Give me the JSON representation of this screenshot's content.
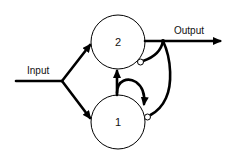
{
  "diagram": {
    "labels": {
      "input": "Input",
      "output": "Output"
    },
    "nodes": [
      {
        "id": "2",
        "label": "2",
        "cx": 118,
        "cy": 42,
        "r": 27
      },
      {
        "id": "1",
        "label": "1",
        "cx": 118,
        "cy": 122,
        "r": 27
      }
    ],
    "edges": [
      {
        "from": "input",
        "to": "2",
        "type": "excitatory"
      },
      {
        "from": "input",
        "to": "1",
        "type": "excitatory"
      },
      {
        "from": "1",
        "to": "2",
        "type": "excitatory"
      },
      {
        "from": "1",
        "to": "1",
        "type": "excitatory-self-loop"
      },
      {
        "from": "2",
        "to": "output",
        "type": "excitatory"
      },
      {
        "from": "output",
        "to": "2",
        "type": "inhibitory"
      },
      {
        "from": "output",
        "to": "1",
        "type": "inhibitory"
      }
    ],
    "colors": {
      "stroke": "#000000",
      "background": "#ffffff"
    }
  }
}
